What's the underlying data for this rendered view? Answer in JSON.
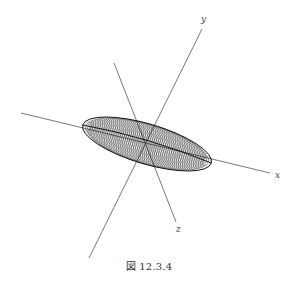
{
  "figure": {
    "caption": "図 12.3.4",
    "axes": [
      {
        "name": "x",
        "label": "x",
        "from": [
          21,
          113
        ],
        "to": [
          270,
          173
        ],
        "label_pos": [
          275,
          178
        ]
      },
      {
        "name": "y",
        "label": "y",
        "from": [
          89,
          258
        ],
        "to": [
          202,
          29
        ],
        "label_pos": [
          201,
          22
        ]
      },
      {
        "name": "z",
        "label": "z",
        "from": [
          114,
          63
        ],
        "to": [
          176,
          222
        ],
        "label_pos": [
          176,
          232
        ]
      }
    ],
    "surface": {
      "type": "ellipsoid-wireframe",
      "center": [
        147,
        144
      ],
      "semi_major": 67,
      "rotation_deg": 16.5,
      "ring_count": 64,
      "ring_rx": 6.5,
      "ring_ry_max": 20,
      "stroke_color": "#111111"
    },
    "colors": {
      "axis": "#555555",
      "background": "#ffffff"
    }
  }
}
